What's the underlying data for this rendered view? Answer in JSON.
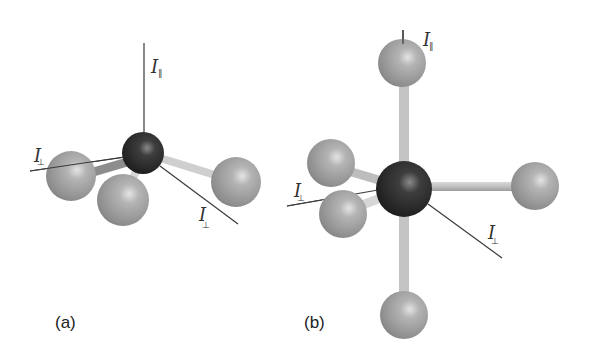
{
  "figure": {
    "panels": [
      {
        "id": "a",
        "label": "(a)",
        "geometry": "trigonal pyramidal",
        "axis_labels": {
          "parallel": {
            "symbol": "I",
            "subscript": "∥"
          },
          "perp_left": {
            "symbol": "I",
            "subscript": "⊥"
          },
          "perp_right": {
            "symbol": "I",
            "subscript": "⊥"
          }
        }
      },
      {
        "id": "b",
        "label": "(b)",
        "geometry": "octahedral",
        "axis_labels": {
          "parallel": {
            "symbol": "I",
            "subscript": "∥"
          },
          "perp_left": {
            "symbol": "I",
            "subscript": "⊥"
          },
          "perp_right": {
            "symbol": "I",
            "subscript": "⊥"
          }
        }
      }
    ],
    "colors": {
      "central_atom": "#2a2a2a",
      "ligand_atom": "#9a9a9a",
      "bond": "#c8c8c8",
      "axis_line": "#3a3a3a",
      "background": "#ffffff"
    }
  }
}
